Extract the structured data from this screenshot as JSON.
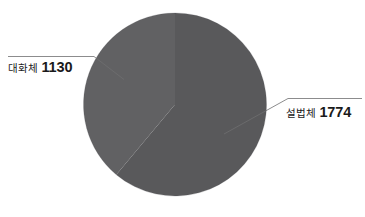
{
  "chart_data": {
    "type": "pie",
    "title": "",
    "subtitle": "",
    "xlabel": "",
    "ylabel": "",
    "grid": false,
    "legend_position": "none",
    "labels_outside": true,
    "total": 2904,
    "categories": [
      "설법체",
      "대화체"
    ],
    "values": [
      1774,
      1130
    ],
    "slices": [
      {
        "label": "설법체",
        "value": 1774,
        "value_text": "1774",
        "percent": 61.1,
        "color": "#59595b",
        "start_angle_deg": 0,
        "end_angle_deg": 220,
        "leader_side": "right"
      },
      {
        "label": "대화체",
        "value": 1130,
        "value_text": "1130",
        "percent": 38.9,
        "color": "#616163",
        "start_angle_deg": 220,
        "end_angle_deg": 360,
        "leader_side": "left"
      }
    ],
    "annotations": [
      {
        "text": "대화체 1130",
        "position": "left"
      },
      {
        "text": "설법체 1774",
        "position": "right"
      }
    ]
  },
  "colors": {
    "background": "#ffffff",
    "slice_seolbeopche": "#59595b",
    "slice_daehwache": "#616163",
    "leader_line": "#6e6e70",
    "text": "#1a1a1a"
  },
  "labels": {
    "left": {
      "name": "대화체",
      "value": "1130"
    },
    "right": {
      "name": "설법체",
      "value": "1774"
    }
  }
}
